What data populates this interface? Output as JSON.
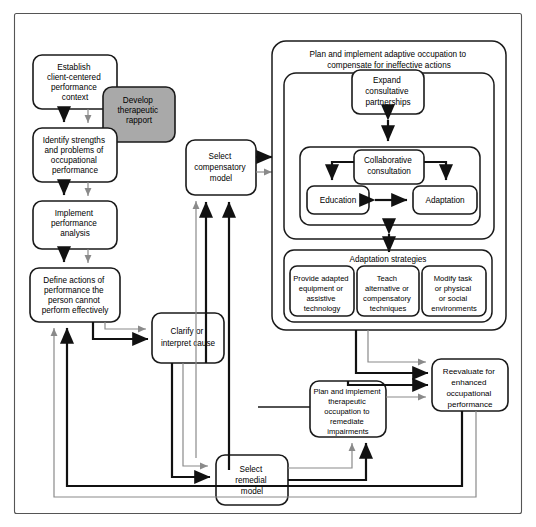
{
  "diagram": {
    "colors": {
      "shaded_box_fill": "#a9a9a9",
      "box_fill": "#ffffff",
      "box_stroke": "#1a1a1a",
      "arrow_dark": "#111111",
      "arrow_gray": "#8a8a8a",
      "frame_stroke": "#555555",
      "page_background": "#ffffff"
    },
    "left_column": [
      {
        "id": "establish-context",
        "label": "Establish\nclient-centered\nperformance\ncontext"
      },
      {
        "id": "identify-strengths",
        "label": "Identify strengths\nand problems of\noccupational\nperformance"
      },
      {
        "id": "implement-analysis",
        "label": "Implement\nperformance\nanalysis"
      },
      {
        "id": "define-actions",
        "label": "Define actions of\nperformance the\nperson cannot\nperform effectively"
      }
    ],
    "shaded_box": {
      "id": "develop-rapport",
      "label": "Develop\ntherapeutic\nrapport"
    },
    "middle_boxes": [
      {
        "id": "clarify-cause",
        "label": "Clarify or\ninterpret cause"
      },
      {
        "id": "select-compensatory",
        "label": "Select\ncompensatory\nmodel"
      },
      {
        "id": "select-remedial",
        "label": "Select\nremedial\nmodel"
      }
    ],
    "adaptive_group": {
      "id": "adaptive-occupation-group",
      "header": "Plan and implement adaptive occupation to\ncompensate for ineffective actions",
      "expand": {
        "id": "expand-partnerships",
        "label": "Expand\nconsultative\npartnerships"
      },
      "consultation": {
        "id": "collaborative-consultation",
        "label": "Collaborative\nconsultation",
        "children": [
          {
            "id": "education",
            "label": "Education"
          },
          {
            "id": "adaptation",
            "label": "Adaptation"
          }
        ]
      },
      "adaptation_strategies": {
        "id": "adaptation-strategies",
        "header": "Adaptation strategies",
        "items": [
          {
            "id": "provide-adapted-equipment",
            "label": "Provide adapted\nequipment or\nassistive\ntechnology"
          },
          {
            "id": "teach-alternative",
            "label": "Teach\nalternative or\ncompensatory\ntechniques"
          },
          {
            "id": "modify-task",
            "label": "Modify task\nor physical\nor social\nenvironments"
          }
        ]
      }
    },
    "remediate_box": {
      "id": "remediate-impairments",
      "label": "Plan and implement\ntherapeutic\noccupation to\nremediate\nimpairments"
    },
    "reevaluate_box": {
      "id": "reevaluate-performance",
      "label": "Reevaluate for\nenhanced\noccupational\nperformance"
    }
  }
}
